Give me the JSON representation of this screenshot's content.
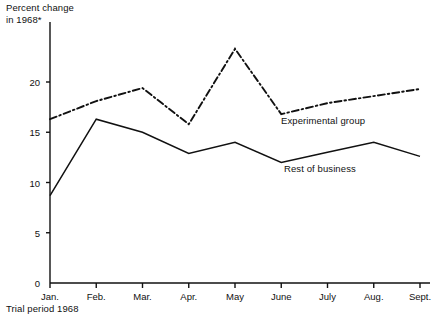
{
  "chart_data": {
    "type": "line",
    "title": "",
    "ylabel": "Percent change\nin 1968*",
    "xlabel": "Trial period 1968",
    "categories": [
      "Jan.",
      "Feb.",
      "Mar.",
      "Apr.",
      "May",
      "June",
      "July",
      "Aug.",
      "Sept."
    ],
    "ylim": [
      0,
      22
    ],
    "yticks": [
      0,
      5,
      10,
      15,
      20
    ],
    "ytick_labels": [
      "0",
      "5",
      "10",
      "15",
      "20"
    ],
    "grid": false,
    "legend_position": "inline-annotation",
    "series": [
      {
        "name": "Experimental group",
        "style": "dash-dot",
        "color": "#111111",
        "values": [
          16.3,
          18.1,
          19.4,
          15.8,
          23.3,
          16.8,
          17.9,
          18.6,
          19.3
        ]
      },
      {
        "name": "Rest of business",
        "style": "solid",
        "color": "#111111",
        "values": [
          8.7,
          16.3,
          15.0,
          12.9,
          14.0,
          12.0,
          13.0,
          14.0,
          12.6
        ]
      }
    ],
    "annotations": [
      {
        "text": "Experimental group",
        "series": "Experimental group"
      },
      {
        "text": "Rest of business",
        "series": "Rest of business"
      }
    ]
  },
  "axis": {
    "y_title_line1": "Percent change",
    "y_title_line2": "in 1968*",
    "footer": "Trial period 1968"
  }
}
